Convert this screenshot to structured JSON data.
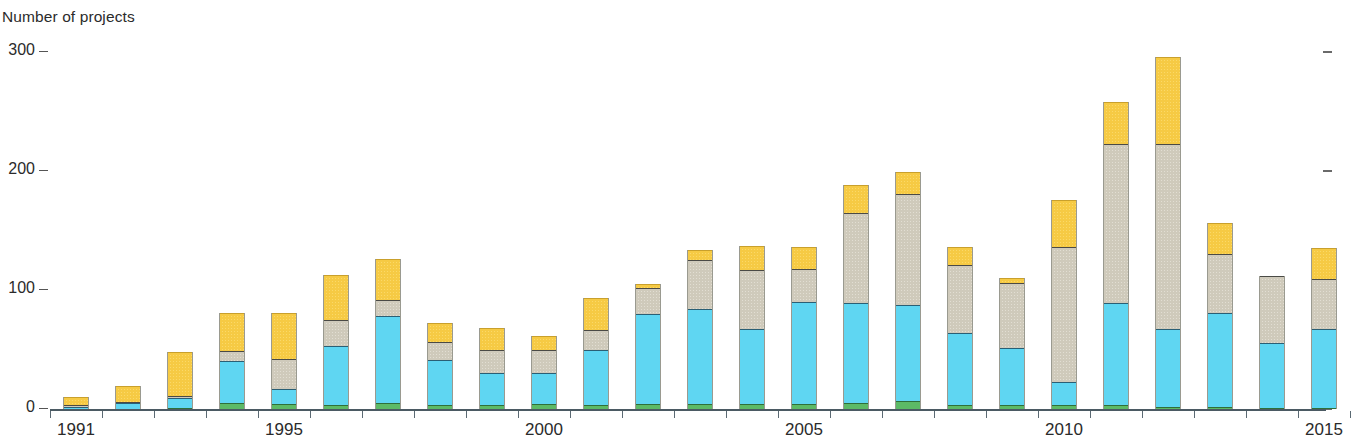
{
  "chart_data": {
    "type": "bar",
    "stacked": true,
    "title": "Number of projects",
    "xlabel": "",
    "ylabel": "Number of projects",
    "ylim": [
      0,
      300
    ],
    "yticks": [
      0,
      100,
      200,
      300
    ],
    "ytick_labels": [
      "0",
      "100",
      "200",
      "300"
    ],
    "grid": false,
    "legend_position": "none",
    "categories": [
      1991,
      1992,
      1993,
      1994,
      1995,
      1996,
      1997,
      1998,
      1999,
      2000,
      2001,
      2002,
      2003,
      2004,
      2005,
      2006,
      2007,
      2008,
      2009,
      2010,
      2011,
      2012,
      2013,
      2014,
      2015
    ],
    "xtick_labels": [
      "1991",
      "1995",
      "2000",
      "2005",
      "2010",
      "2015"
    ],
    "xtick_categories": [
      1991,
      1995,
      2000,
      2005,
      2010,
      2015
    ],
    "series": [
      {
        "name": "green-segment",
        "color": "#5cba66",
        "values": [
          0,
          0,
          1,
          5,
          4,
          3,
          5,
          3,
          3,
          4,
          3,
          4,
          4,
          4,
          4,
          5,
          7,
          3,
          3,
          3,
          3,
          2,
          2,
          1,
          1
        ]
      },
      {
        "name": "cyan-segment",
        "color": "#5fd6f2",
        "values": [
          2,
          5,
          8,
          35,
          13,
          50,
          73,
          38,
          27,
          26,
          47,
          76,
          80,
          63,
          86,
          84,
          80,
          61,
          48,
          20,
          86,
          65,
          79,
          54,
          66
        ]
      },
      {
        "name": "gray-segment",
        "color": "#cfcabb",
        "values": [
          1,
          1,
          2,
          9,
          25,
          22,
          14,
          15,
          20,
          20,
          16,
          22,
          41,
          50,
          28,
          76,
          94,
          57,
          55,
          113,
          134,
          156,
          49,
          57,
          42
        ]
      },
      {
        "name": "yellow-segment",
        "color": "#f6ca44",
        "values": [
          7,
          13,
          37,
          32,
          39,
          38,
          34,
          16,
          18,
          11,
          27,
          3,
          9,
          20,
          18,
          23,
          18,
          15,
          4,
          40,
          35,
          73,
          26,
          0,
          26
        ]
      }
    ],
    "totals": [
      10,
      19,
      48,
      81,
      81,
      113,
      126,
      72,
      68,
      61,
      93,
      105,
      134,
      137,
      136,
      188,
      199,
      136,
      110,
      176,
      258,
      296,
      156,
      112,
      135
    ]
  }
}
